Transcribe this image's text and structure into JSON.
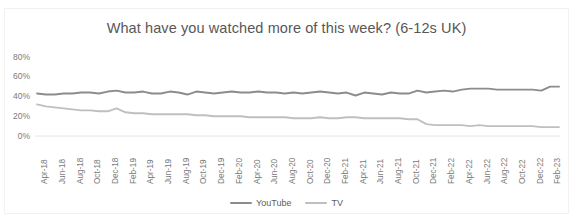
{
  "chart_data": {
    "type": "line",
    "title": "What have you watched more of this week? (6-12s UK)",
    "xlabel": "",
    "ylabel": "",
    "ylim": [
      0,
      80
    ],
    "yticks": [
      "0%",
      "20%",
      "40%",
      "60%",
      "80%"
    ],
    "ytick_values": [
      0,
      20,
      40,
      60,
      80
    ],
    "grid": false,
    "legend_position": "bottom-center",
    "x": [
      "Apr-18",
      "May-18",
      "Jun-18",
      "Jul-18",
      "Aug-18",
      "Sep-18",
      "Oct-18",
      "Nov-18",
      "Dec-18",
      "Jan-19",
      "Feb-19",
      "Mar-19",
      "Apr-19",
      "May-19",
      "Jun-19",
      "Jul-19",
      "Aug-19",
      "Sep-19",
      "Oct-19",
      "Nov-19",
      "Dec-19",
      "Jan-20",
      "Feb-20",
      "Mar-20",
      "Apr-20",
      "May-20",
      "Jun-20",
      "Jul-20",
      "Aug-20",
      "Sep-20",
      "Oct-20",
      "Nov-20",
      "Dec-20",
      "Jan-21",
      "Feb-21",
      "Mar-21",
      "Apr-21",
      "May-21",
      "Jun-21",
      "Jul-21",
      "Aug-21",
      "Sep-21",
      "Oct-21",
      "Nov-21",
      "Dec-21",
      "Jan-22",
      "Feb-22",
      "Mar-22",
      "Apr-22",
      "May-22",
      "Jun-22",
      "Jul-22",
      "Aug-22",
      "Sep-22",
      "Oct-22",
      "Nov-22",
      "Dec-22",
      "Jan-23",
      "Feb-23",
      "Mar-23"
    ],
    "xtick_labels": [
      "Apr-18",
      "Jun-18",
      "Aug-18",
      "Oct-18",
      "Dec-18",
      "Feb-19",
      "Apr-19",
      "Jun-19",
      "Aug-19",
      "Oct-19",
      "Dec-19",
      "Feb-20",
      "Apr-20",
      "Jun-20",
      "Aug-20",
      "Oct-20",
      "Dec-20",
      "Feb-21",
      "Apr-21",
      "Jun-21",
      "Aug-21",
      "Oct-21",
      "Dec-21",
      "Feb-22",
      "Apr-22",
      "Jun-22",
      "Aug-22",
      "Oct-22",
      "Dec-22",
      "Feb-23"
    ],
    "series": [
      {
        "name": "YouTube",
        "color": "#8c8c8c",
        "values": [
          43,
          42,
          42,
          43,
          43,
          44,
          44,
          43,
          45,
          46,
          44,
          44,
          45,
          43,
          43,
          45,
          44,
          42,
          45,
          44,
          43,
          44,
          45,
          44,
          44,
          45,
          44,
          44,
          43,
          44,
          43,
          44,
          45,
          44,
          43,
          44,
          41,
          44,
          43,
          42,
          44,
          43,
          43,
          46,
          44,
          45,
          46,
          45,
          47,
          48,
          48,
          48,
          47,
          47,
          47,
          47,
          47,
          46,
          50,
          50
        ]
      },
      {
        "name": "TV",
        "color": "#bfbfbf",
        "values": [
          32,
          30,
          29,
          28,
          27,
          26,
          26,
          25,
          25,
          28,
          24,
          23,
          23,
          22,
          22,
          22,
          22,
          22,
          21,
          21,
          20,
          20,
          20,
          20,
          19,
          19,
          19,
          19,
          19,
          18,
          18,
          18,
          19,
          18,
          18,
          19,
          19,
          18,
          18,
          18,
          18,
          18,
          17,
          17,
          12,
          11,
          11,
          11,
          11,
          10,
          11,
          10,
          10,
          10,
          10,
          10,
          10,
          9,
          9,
          9
        ]
      }
    ]
  },
  "legend": {
    "items": [
      {
        "label": "YouTube",
        "color": "#8c8c8c"
      },
      {
        "label": "TV",
        "color": "#bfbfbf"
      }
    ]
  }
}
